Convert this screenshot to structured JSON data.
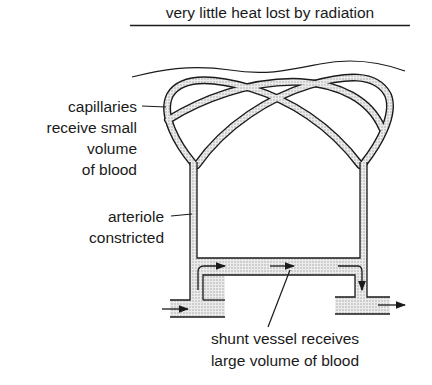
{
  "diagram": {
    "title": "very little heat lost by radiation",
    "labels": {
      "capillaries": [
        "capillaries",
        "receive small",
        "volume",
        "of blood"
      ],
      "arteriole": [
        "arteriole",
        "constricted"
      ],
      "shunt": [
        "shunt vessel receives",
        "large volume of blood"
      ]
    },
    "elements": [
      "skin-surface",
      "capillary-loops",
      "arteriole-left",
      "venule-right",
      "shunt-vessel",
      "blood-flow-arrows"
    ],
    "colors": {
      "ink": "#1a1a1a",
      "vessel_fill": "#d9d9d9",
      "background": "#ffffff"
    }
  }
}
